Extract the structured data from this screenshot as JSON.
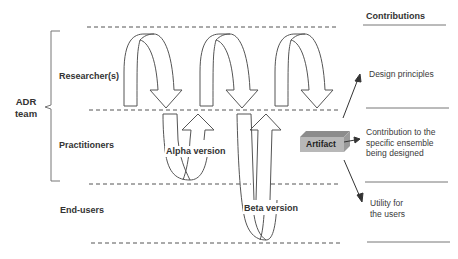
{
  "diagram": {
    "left_group": {
      "bracket_label": "ADR\nteam",
      "roles": [
        {
          "id": "researchers",
          "label": "Researcher(s)"
        },
        {
          "id": "practitioners",
          "label": "Practitioners"
        },
        {
          "id": "end_users",
          "label": "End-users"
        }
      ]
    },
    "versions": [
      {
        "id": "alpha",
        "label": "Alpha version"
      },
      {
        "id": "beta",
        "label": "Beta version"
      }
    ],
    "artifact": {
      "label": "Artifact",
      "colors": {
        "front": "#b8b8b8",
        "top": "#8c8c8c",
        "side": "#9a9a9a"
      }
    },
    "contributions": {
      "header": "Contributions",
      "items": [
        {
          "id": "design_principles",
          "label": "Design principles"
        },
        {
          "id": "ensemble",
          "label": "Contribution to the\nspecific ensemble\nbeing designed"
        },
        {
          "id": "utility",
          "label": "Utility for\nthe users"
        }
      ]
    },
    "colors": {
      "stroke": "#555555",
      "text": "#333333",
      "dash": "#555555"
    }
  }
}
